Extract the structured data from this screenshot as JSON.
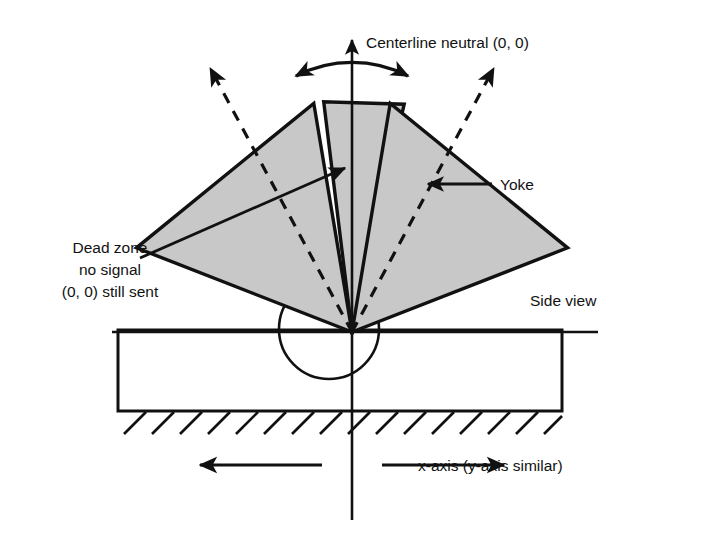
{
  "figure": {
    "type": "technical-diagram",
    "background_color": "#ffffff",
    "line_color": "#111111",
    "wedge_fill_color": "#c8c8c8",
    "wedge_stroke_color": "#111111"
  },
  "labels": {
    "centerline": "Centerline neutral (0, 0)",
    "yoke": "Yoke",
    "side_view": "Side view",
    "x_axis": "x-axis (y-axis similar)",
    "dead_zone_line_1": "Dead zone",
    "dead_zone_line_2": "no signal",
    "dead_zone_line_3": "(0, 0) still sent"
  },
  "geometry": {
    "apex_x": 352,
    "apex_y": 332,
    "circle_center_x": 329,
    "circle_center_y": 329,
    "circle_radius": 50,
    "base_rect": {
      "left": 118,
      "top": 330,
      "right": 562,
      "bottom": 411
    },
    "hatch_count": 16,
    "hatch_spacing": 28,
    "wedge_inner_radius": 0,
    "wedge_outer_radius": 232,
    "wedges": [
      {
        "name": "left-wedge",
        "start_angle_deg": -139,
        "end_angle_deg": -100
      },
      {
        "name": "center-wedge",
        "start_angle_deg": -97,
        "end_angle_deg": -77
      },
      {
        "name": "right-wedge",
        "start_angle_deg": -74,
        "end_angle_deg": -35
      }
    ],
    "dead_zone_gaps_deg": [
      3,
      3
    ],
    "dashed_axis_angles_deg": [
      -119.5,
      -54.5
    ]
  },
  "arrows": {
    "vertical_axis_top_y": 38,
    "vertical_axis_bottom_y": 520,
    "horizontal_axis_left_x": 110,
    "horizontal_axis_right_x": 600,
    "arc_arrow": {
      "radius": 120,
      "start_angle_deg": -118,
      "end_angle_deg": -62
    },
    "x_arrow_left": {
      "from_x": 320,
      "to_x": 198,
      "y": 465
    },
    "x_arrow_right": {
      "from_x": 386,
      "to_x": 508,
      "y": 465
    },
    "yoke_leader": {
      "from_x": 492,
      "to_x": 432,
      "y": 184
    },
    "dead_zone_leader": {
      "from_x": 148,
      "to_x": 340,
      "from_y": 252,
      "to_y": 170
    }
  },
  "label_positions": {
    "centerline": {
      "x": 366,
      "y": 43
    },
    "yoke": {
      "x": 500,
      "y": 189
    },
    "side_view": {
      "x": 530,
      "y": 300
    },
    "x_axis": {
      "x": 418,
      "y": 471
    },
    "dead_zone": {
      "x": 110,
      "y": 247
    }
  }
}
